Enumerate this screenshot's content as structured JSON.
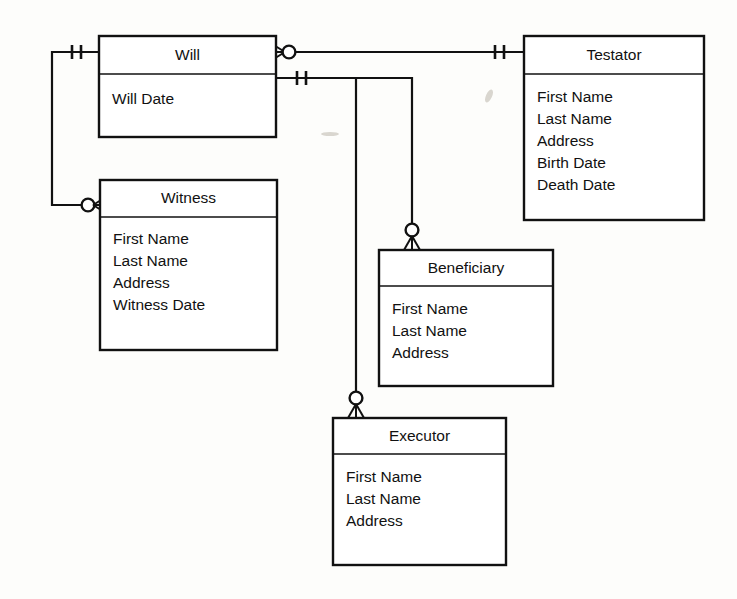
{
  "diagram": {
    "type": "entity-relationship-diagram",
    "notation": "crows-foot",
    "background_color": "#fdfdfb",
    "line_color": "#111111"
  },
  "entities": [
    {
      "id": "will",
      "name": "Will",
      "attributes": [
        "Will Date"
      ],
      "box": {
        "x": 99,
        "y": 36,
        "w": 177,
        "h": 101,
        "header_h": 38
      }
    },
    {
      "id": "testator",
      "name": "Testator",
      "attributes": [
        "First Name",
        "Last Name",
        "Address",
        "Birth Date",
        "Death Date"
      ],
      "box": {
        "x": 524,
        "y": 36,
        "w": 180,
        "h": 184,
        "header_h": 38
      }
    },
    {
      "id": "witness",
      "name": "Witness",
      "attributes": [
        "First Name",
        "Last Name",
        "Address",
        "Witness Date"
      ],
      "box": {
        "x": 100,
        "y": 180,
        "w": 177,
        "h": 170,
        "header_h": 37
      }
    },
    {
      "id": "beneficiary",
      "name": "Beneficiary",
      "attributes": [
        "First Name",
        "Last Name",
        "Address"
      ],
      "box": {
        "x": 379,
        "y": 250,
        "w": 174,
        "h": 136,
        "header_h": 36
      }
    },
    {
      "id": "executor",
      "name": "Executor",
      "attributes": [
        "First Name",
        "Last Name",
        "Address"
      ],
      "box": {
        "x": 333,
        "y": 418,
        "w": 173,
        "h": 147,
        "header_h": 36
      }
    }
  ],
  "relationships": [
    {
      "id": "will-testator",
      "from": "will",
      "to": "testator",
      "from_cardinality": "zero-or-many",
      "to_cardinality": "one-and-only-one",
      "from_symbol": "crowsfoot-circle",
      "to_symbol": "double-tick"
    },
    {
      "id": "will-witness",
      "from": "will",
      "to": "witness",
      "from_cardinality": "one-and-only-one",
      "to_cardinality": "zero-or-many",
      "from_symbol": "double-tick",
      "to_symbol": "circle-crowsfoot"
    },
    {
      "id": "will-beneficiary",
      "from": "will",
      "to": "beneficiary",
      "from_cardinality": "one-and-only-one",
      "to_cardinality": "zero-or-many",
      "from_symbol": "double-tick",
      "to_symbol": "circle-crowsfoot"
    },
    {
      "id": "will-executor",
      "from": "will",
      "to": "executor",
      "from_cardinality": "one-and-only-one",
      "to_cardinality": "zero-or-many",
      "from_symbol": "double-tick",
      "to_symbol": "circle-crowsfoot"
    }
  ]
}
